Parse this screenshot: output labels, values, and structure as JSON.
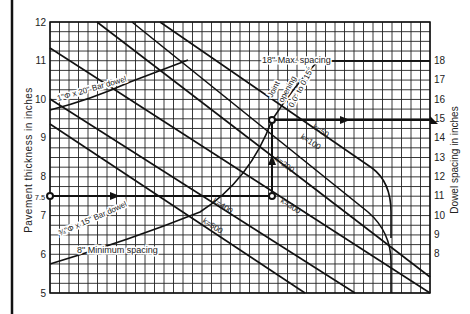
{
  "chart_data": {
    "type": "line",
    "title": "",
    "ylabel": "Pavement thickness in inches",
    "y2label": "Dowel spacing in inches",
    "ylim": [
      5,
      12
    ],
    "y2lim": [
      8,
      18
    ],
    "yticks": [
      "5",
      "6",
      "7",
      "8",
      "9",
      "10",
      "11",
      "12"
    ],
    "y2ticks": [
      "8",
      "9",
      "10",
      "11",
      "12",
      "13",
      "14",
      "15",
      "16",
      "17",
      "18"
    ],
    "grid": true,
    "series": [
      {
        "name": "k=50",
        "label": "k=50"
      },
      {
        "name": "k=100",
        "label": "k=100"
      },
      {
        "name": "k=200",
        "label": "k=200"
      },
      {
        "name": "k=300",
        "label": "k=300"
      },
      {
        "name": "k=400",
        "label": "k=400"
      },
      {
        "name": "k=500",
        "label": "k=500"
      }
    ],
    "annotations": {
      "max_spacing": "18\" Max. spacing",
      "min_spacing": "8\" Minimum spacing",
      "bar_dowel_large": "1\"Φ x 20\" Bar dowel",
      "bar_dowel_small": "¾\"Φ x 15\" Bar dowel",
      "joint_opening_1": "Joint",
      "joint_opening_2": "opening",
      "joint_opening_3": "0.0\" to 0.15\"",
      "example_thickness": "7.5",
      "example_result_spacing": 13.4,
      "example_k": 300
    }
  }
}
